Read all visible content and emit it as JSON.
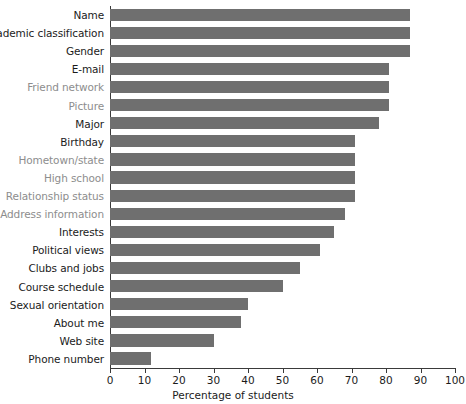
{
  "chart_data": {
    "type": "bar",
    "orientation": "horizontal",
    "title": "",
    "xlabel": "Percentage of students",
    "ylabel": "",
    "xlim": [
      0,
      100
    ],
    "xticks": [
      0,
      10,
      20,
      30,
      40,
      50,
      60,
      70,
      80,
      90,
      100
    ],
    "grid": false,
    "legend": null,
    "bar_color": "#6f6f6f",
    "categories": [
      "Name",
      "Academic classification",
      "Gender",
      "E-mail",
      "Friend network",
      "Picture",
      "Major",
      "Birthday",
      "Hometown/state",
      "High school",
      "Relationship status",
      "Address information",
      "Interests",
      "Political views",
      "Clubs and jobs",
      "Course schedule",
      "Sexual orientation",
      "About me",
      "Web site",
      "Phone number"
    ],
    "values": [
      87,
      87,
      87,
      81,
      81,
      81,
      78,
      71,
      71,
      71,
      71,
      68,
      65,
      61,
      55,
      50,
      40,
      38,
      30,
      12
    ],
    "label_colors": [
      "dark",
      "dark",
      "dark",
      "dark",
      "dim",
      "dim",
      "dark",
      "dark",
      "dim",
      "dim",
      "dim",
      "dim",
      "dark",
      "dark",
      "dark",
      "dark",
      "dark",
      "dark",
      "dark",
      "dark"
    ]
  },
  "axis": {
    "x_title": "Percentage of students"
  }
}
